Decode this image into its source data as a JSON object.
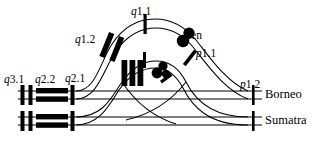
{
  "figure": {
    "type": "chromosome-homology-diagram",
    "ink_color": "#000000",
    "background_color": "#ffffff"
  },
  "band_labels": {
    "q3_1": {
      "prefix": "q",
      "number": "3.1",
      "x": 4,
      "y": 74
    },
    "q2_2": {
      "prefix": "q",
      "number": "2.2",
      "x": 35,
      "y": 74
    },
    "q2_1": {
      "prefix": "q",
      "number": "2.1",
      "x": 65,
      "y": 73
    },
    "q1_2": {
      "prefix": "q",
      "number": "1.2",
      "x": 75,
      "y": 34
    },
    "q1_1": {
      "prefix": "q",
      "number": "1.1",
      "x": 131,
      "y": 6
    },
    "cen": {
      "prefix": "",
      "number": "cen",
      "x": 186,
      "y": 30
    },
    "p1_1": {
      "prefix": "p",
      "number": "1.1",
      "x": 196,
      "y": 48
    },
    "p1_2": {
      "prefix": "p",
      "number": "1.2",
      "x": 240,
      "y": 79
    }
  },
  "species_labels": [
    {
      "name": "Borneo",
      "x": 265,
      "y": 93
    },
    {
      "name": "Sumatra",
      "x": 265,
      "y": 117
    }
  ],
  "rows": {
    "borneo": {
      "line_top_y": 91,
      "line_bottom_y": 99,
      "left_x": 18,
      "right_x": 262
    },
    "sumatra": {
      "line_top_y": 117,
      "line_bottom_y": 125,
      "left_x": 18,
      "right_x": 262
    }
  },
  "left_features": {
    "tick_positions_x": [
      22,
      30,
      72
    ],
    "block_span_x": [
      36,
      68
    ]
  },
  "center_features": {
    "vertical_bars_x": [
      124,
      132,
      140
    ],
    "dot_cluster_x": 160,
    "dot_cluster_y": 72
  }
}
